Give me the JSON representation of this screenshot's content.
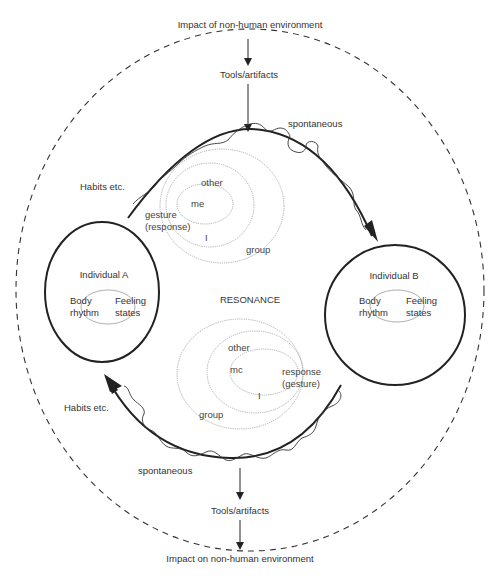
{
  "diagram": {
    "top": {
      "impact_label": "Impact of non-human environment",
      "tools_label": "Tools/artifacts"
    },
    "bottom": {
      "tools_label": "Tools/artifacts",
      "impact_label": "Impact on non-human environment"
    },
    "center_label": "RESONANCE",
    "individual_a": {
      "title": "Individual A",
      "left_label_1": "Body",
      "left_label_2": "rhythm",
      "right_label_1": "Feeling",
      "right_label_2": "states"
    },
    "individual_b": {
      "title": "Individual B",
      "left_label_1": "Body",
      "left_label_2": "rhythm",
      "right_label_1": "Feeling",
      "right_label_2": "states"
    },
    "top_arc": {
      "habits_label": "Habits etc.",
      "spontaneous_label": "spontaneous",
      "rings": {
        "other": "other",
        "me": "me",
        "gesture_1": "gesture",
        "gesture_2": "(response)",
        "i": "I",
        "group": "group"
      }
    },
    "bottom_arc": {
      "habits_label": "Habits etc.",
      "spontaneous_label": "spontaneous",
      "rings": {
        "other": "other",
        "me": "mc",
        "response_1": "response",
        "response_2": "(gesture)",
        "i": "I",
        "group": "group"
      }
    },
    "colors": {
      "stroke_dark": "#222222",
      "stroke_light": "#9a9a9a",
      "text": "#333333",
      "background": "#ffffff"
    }
  }
}
